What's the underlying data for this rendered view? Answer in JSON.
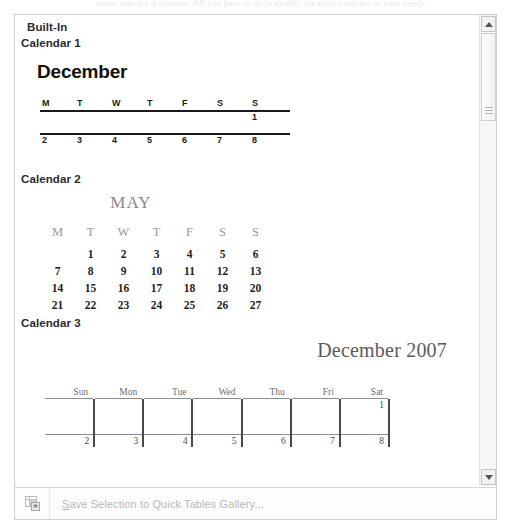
{
  "ghost_text": "insert into the document. All you have to do is modify the table contents to your needs.",
  "panel": {
    "category_header": "Built-In",
    "scrollbar": {
      "up_icon": "triangle-up-icon",
      "down_icon": "triangle-down-icon",
      "thumb": "scrollbar-thumb"
    },
    "items": [
      {
        "label": "Calendar 1",
        "preview": {
          "title": "December",
          "day_headers": [
            "M",
            "T",
            "W",
            "T",
            "F",
            "S",
            "S"
          ],
          "week1": [
            "",
            "",
            "",
            "",
            "",
            "",
            "1"
          ],
          "week2": [
            "2",
            "3",
            "4",
            "5",
            "6",
            "7",
            "8"
          ]
        }
      },
      {
        "label": "Calendar 2",
        "preview": {
          "title": "MAY",
          "day_headers": [
            "M",
            "T",
            "W",
            "T",
            "F",
            "S",
            "S"
          ],
          "weeks": [
            [
              "",
              "1",
              "2",
              "3",
              "4",
              "5",
              "6"
            ],
            [
              "7",
              "8",
              "9",
              "10",
              "11",
              "12",
              "13"
            ],
            [
              "14",
              "15",
              "16",
              "17",
              "18",
              "19",
              "20"
            ],
            [
              "21",
              "22",
              "23",
              "24",
              "25",
              "26",
              "27"
            ]
          ]
        }
      },
      {
        "label": "Calendar 3",
        "preview": {
          "title": "December 2007",
          "day_headers": [
            "Sun",
            "Mon",
            "Tue",
            "Wed",
            "Thu",
            "Fri",
            "Sat"
          ],
          "weeks": [
            [
              "",
              "",
              "",
              "",
              "",
              "",
              "1"
            ],
            [
              "2",
              "3",
              "4",
              "5",
              "6",
              "7",
              "8"
            ]
          ]
        }
      }
    ]
  },
  "command_bar": {
    "icon": "save-table-to-gallery-icon",
    "label": "Save Selection to Quick Tables Gallery...",
    "label_prefix": "S",
    "label_rest": "ave Selection to Quick Tables Gallery..."
  }
}
